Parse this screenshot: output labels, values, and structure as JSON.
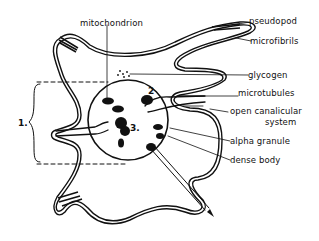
{
  "diagram": {
    "labels": {
      "mitochondrion": "mitochondrion",
      "pseudopod": "pseudopod",
      "microfibrils": "microfibrils",
      "glycogen": "glycogen",
      "microtubules": "microtubules",
      "open_canalicular_1": "open canalicular",
      "open_canalicular_2": "system",
      "alpha_granule": "alpha granule",
      "dense_body": "dense body"
    },
    "region_numbers": {
      "one": "1.",
      "two": "2",
      "three": "3."
    },
    "colors": {
      "ink": "#111111",
      "background": "#ffffff"
    }
  }
}
